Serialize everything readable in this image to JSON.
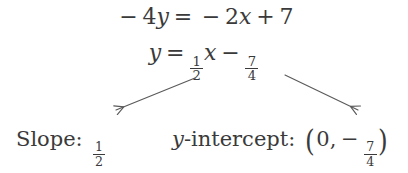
{
  "figure": {
    "kind": "math-worked-example",
    "background_color": "#ffffff",
    "ink_color": "#3a3a3a"
  },
  "equations": {
    "line1": {
      "full_text": "−4y = −2x + 7",
      "minus_sign": "−",
      "coefficient_4": "4",
      "var_y": "y",
      "equals": "=",
      "coefficient_2": "2",
      "var_x": "x",
      "plus": "+",
      "constant_7": "7"
    },
    "line2": {
      "full_text": "y = ½x − 7/4",
      "var_y": "y",
      "equals": "=",
      "slope_fraction": {
        "numerator": "1",
        "denominator": "2"
      },
      "var_x": "x",
      "minus": "−",
      "intercept_fraction": {
        "numerator": "7",
        "denominator": "4"
      }
    }
  },
  "results": {
    "slope": {
      "label": "Slope:",
      "value_fraction": {
        "numerator": "1",
        "denominator": "2"
      }
    },
    "intercept": {
      "label_var": "y",
      "label_rest": "-intercept:",
      "paren_open": "(",
      "x_value": "0",
      "comma": ",",
      "minus": "−",
      "value_fraction": {
        "numerator": "7",
        "denominator": "4"
      },
      "paren_close": ")"
    }
  },
  "arrows": [
    {
      "name": "arrow-to-slope",
      "direction": "down-left",
      "from_x": 195,
      "from_y": 78,
      "to_x": 112,
      "to_y": 112,
      "color": "#5a5a5a"
    },
    {
      "name": "arrow-to-intercept",
      "direction": "down-right",
      "from_x": 285,
      "from_y": 75,
      "to_x": 362,
      "to_y": 112,
      "color": "#5a5a5a"
    }
  ]
}
